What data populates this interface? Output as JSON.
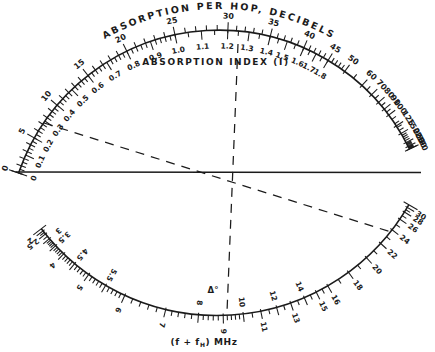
{
  "figure": {
    "background": "#ffffff",
    "ink": "#1b1b1b",
    "top_title": "ABSORPTION PER HOP, DECIBELS",
    "inner_title": "ABSORPTION INDEX (I)",
    "bottom_title_pre": "(f + f",
    "bottom_title_sub": "H",
    "bottom_title_post": ")  MHz",
    "delta_annotation": "Δ°"
  },
  "chart_data": {
    "type": "nomogram",
    "title": "ABSORPTION PER HOP, DECIBELS",
    "subtitle": "ABSORPTION INDEX (I)",
    "xlabel": "(f + fH) MHz",
    "legend": "none",
    "grid": false,
    "scales": {
      "absorption_db": {
        "name": "ABSORPTION PER HOP, DECIBELS",
        "units": "dB",
        "side": "outer",
        "labeled_ticks": [
          0,
          5,
          10,
          15,
          20,
          25,
          30,
          35,
          40,
          45,
          50,
          60,
          70,
          80,
          90,
          100,
          125,
          150,
          200,
          250,
          300
        ],
        "anchors_value_angle_deg": [
          [
            0,
            161
          ],
          [
            5,
            150.6
          ],
          [
            10,
            139.8
          ],
          [
            15,
            128.2
          ],
          [
            20,
            115.8
          ],
          [
            25,
            102
          ],
          [
            30,
            87.6
          ],
          [
            35,
            76
          ],
          [
            40,
            66.4
          ],
          [
            45,
            59
          ],
          [
            50,
            53.6
          ],
          [
            60,
            47.6
          ],
          [
            70,
            44
          ],
          [
            80,
            41.2
          ],
          [
            90,
            38.8
          ],
          [
            100,
            36.8
          ],
          [
            125,
            33.2
          ],
          [
            150,
            30.8
          ],
          [
            200,
            28
          ],
          [
            250,
            26.8
          ],
          [
            300,
            26
          ]
        ],
        "minor_steps": [
          [
            0,
            50,
            1
          ],
          [
            50,
            100,
            5
          ],
          [
            100,
            300,
            10
          ]
        ]
      },
      "absorption_index": {
        "name": "ABSORPTION INDEX (I)",
        "side": "inner",
        "labeled_ticks": [
          0,
          0.1,
          0.2,
          0.3,
          0.4,
          0.5,
          0.6,
          0.7,
          0.8,
          0.9,
          1.0,
          1.1,
          1.2,
          1.3,
          1.4,
          1.5,
          1.6,
          1.7,
          1.8
        ],
        "db_per_unit": 25,
        "minor_steps": [
          [
            0,
            1,
            0.02
          ],
          [
            1,
            1.8,
            0.05
          ]
        ]
      },
      "frequency_mhz": {
        "name": "(f + fH) MHz",
        "units": "MHz",
        "labeled_ticks": [
          2,
          2.5,
          3,
          3.5,
          4,
          4.5,
          5,
          5.5,
          6,
          7,
          8,
          9,
          10,
          11,
          12,
          13,
          14,
          15,
          16,
          18,
          20,
          22,
          24,
          26,
          28,
          30
        ],
        "anchors_value_angle_deg": [
          [
            2,
            -141.8
          ],
          [
            2.5,
            -140.8
          ],
          [
            3,
            -139.2
          ],
          [
            3.5,
            -136.8
          ],
          [
            4,
            -133.8
          ],
          [
            4.5,
            -130
          ],
          [
            5,
            -125.4
          ],
          [
            5.5,
            -120.2
          ],
          [
            6,
            -114.6
          ],
          [
            7,
            -103.4
          ],
          [
            8,
            -94.8
          ],
          [
            9,
            -88.4
          ],
          [
            10,
            -83.2
          ],
          [
            11,
            -78.6
          ],
          [
            12,
            -74.4
          ],
          [
            13,
            -70.6
          ],
          [
            14,
            -66.8
          ],
          [
            15,
            -63.4
          ],
          [
            16,
            -60
          ],
          [
            18,
            -53.6
          ],
          [
            20,
            -47.6
          ],
          [
            22,
            -42.4
          ],
          [
            24,
            -37.8
          ],
          [
            26,
            -34.4
          ],
          [
            28,
            -32.2
          ],
          [
            30,
            -30.8
          ]
        ],
        "inside_labels": [
          3,
          3.5,
          4.5,
          5.5,
          8,
          10,
          12,
          14
        ],
        "minor_steps": [
          [
            2,
            3,
            0.25
          ],
          [
            3,
            6,
            0.1
          ],
          [
            6,
            10,
            0.2
          ],
          [
            10,
            16,
            0.5
          ],
          [
            16,
            30,
            1
          ]
        ]
      }
    },
    "geometry": {
      "canvas": [
        435,
        352
      ],
      "top_arc": {
        "cx": 219,
        "cy": 242,
        "r": 212,
        "start_deg": 161,
        "end_deg": 26
      },
      "bottom_arc": {
        "cx": 217,
        "cy": 94,
        "r": 221.5,
        "start_deg": -142.5,
        "end_deg": -30
      }
    },
    "reference_lines": [
      {
        "name": "horizontal-zero-line",
        "style": "solid",
        "x1": 16,
        "y1": 172,
        "x2": 421,
        "y2": 172.5
      },
      {
        "name": "vertical-reference-dashed-line",
        "style": "dashed",
        "x1": 238,
        "y1": 44,
        "x2": 227,
        "y2": 312
      },
      {
        "name": "diagonal-example-dashed-line",
        "style": "dashed",
        "x1": 44,
        "y1": 123,
        "x2": 391,
        "y2": 232
      }
    ]
  }
}
